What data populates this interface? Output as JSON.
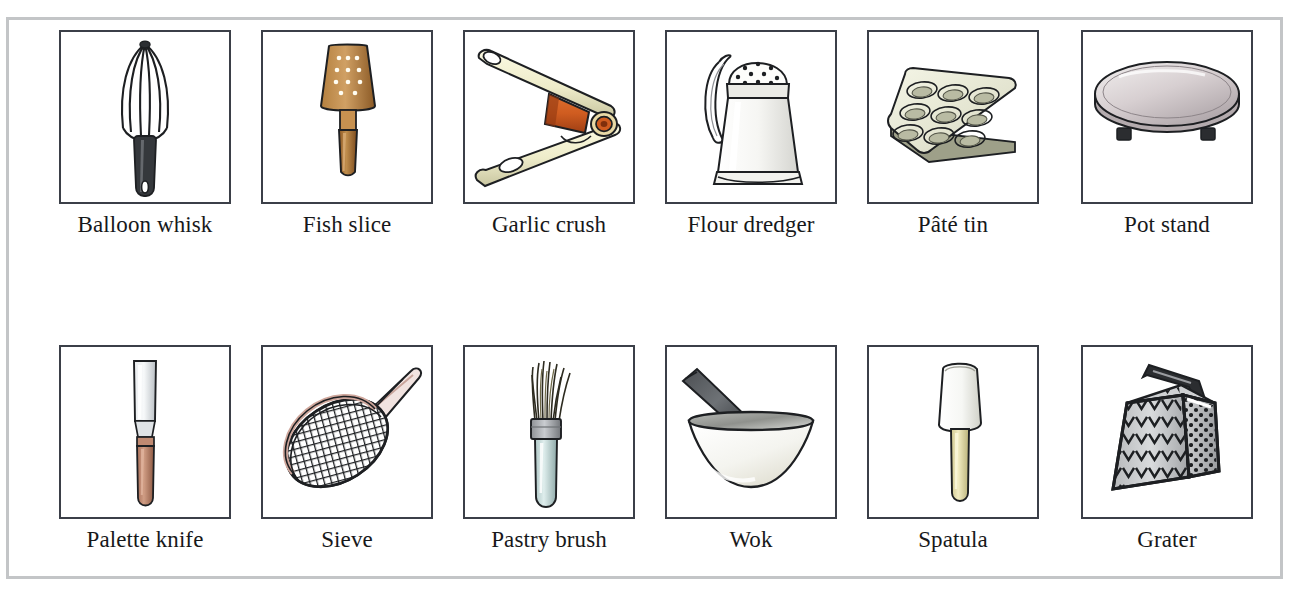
{
  "page": {
    "kind": "picture-dictionary-grid",
    "columns": 6,
    "rows": 2,
    "border_color": "#c3c5c7",
    "frame_color": "#3b3f48",
    "background": "#ffffff"
  },
  "palette": {
    "wood_dark": "#8a5a2b",
    "wood_mid": "#b3793f",
    "wood_light": "#d9a867",
    "handle_pink": "#c08a72",
    "metal_light": "#e8e9ea",
    "metal_mid": "#b8b9bb",
    "metal_dark": "#6f7174",
    "cream": "#f2f0d8",
    "ivory": "#efeccd",
    "copper": "#d4622a",
    "copper_dark": "#a8431c",
    "pale_tin": "#e6e7d6",
    "ink": "#1d1f22",
    "pale_blue": "#cfe1e0",
    "stand_grey": "#c9c2c4"
  },
  "items": [
    {
      "index": 1,
      "row": 1,
      "column": 1,
      "label": "Balloon whisk",
      "icon": "balloon-whisk-icon",
      "left": 59
    },
    {
      "index": 2,
      "row": 1,
      "column": 2,
      "label": "Fish slice",
      "icon": "fish-slice-icon",
      "left": 261
    },
    {
      "index": 3,
      "row": 1,
      "column": 3,
      "label": "Garlic crush",
      "icon": "garlic-crush-icon",
      "left": 463
    },
    {
      "index": 4,
      "row": 1,
      "column": 4,
      "label": "Flour dredger",
      "icon": "flour-dredger-icon",
      "left": 665
    },
    {
      "index": 5,
      "row": 1,
      "column": 5,
      "label": "Pâté tin",
      "icon": "pate-tin-icon",
      "left": 867
    },
    {
      "index": 6,
      "row": 1,
      "column": 6,
      "label": "Pot stand",
      "icon": "pot-stand-icon",
      "left": 1081
    },
    {
      "index": 7,
      "row": 2,
      "column": 1,
      "label": "Palette knife",
      "icon": "palette-knife-icon",
      "left": 59
    },
    {
      "index": 8,
      "row": 2,
      "column": 2,
      "label": "Sieve",
      "icon": "sieve-icon",
      "left": 261
    },
    {
      "index": 9,
      "row": 2,
      "column": 3,
      "label": "Pastry brush",
      "icon": "pastry-brush-icon",
      "left": 463
    },
    {
      "index": 10,
      "row": 2,
      "column": 4,
      "label": "Wok",
      "icon": "wok-icon",
      "left": 665
    },
    {
      "index": 11,
      "row": 2,
      "column": 5,
      "label": "Spatula",
      "icon": "spatula-icon",
      "left": 867
    },
    {
      "index": 12,
      "row": 2,
      "column": 6,
      "label": "Grater",
      "icon": "grater-icon",
      "left": 1081
    }
  ]
}
